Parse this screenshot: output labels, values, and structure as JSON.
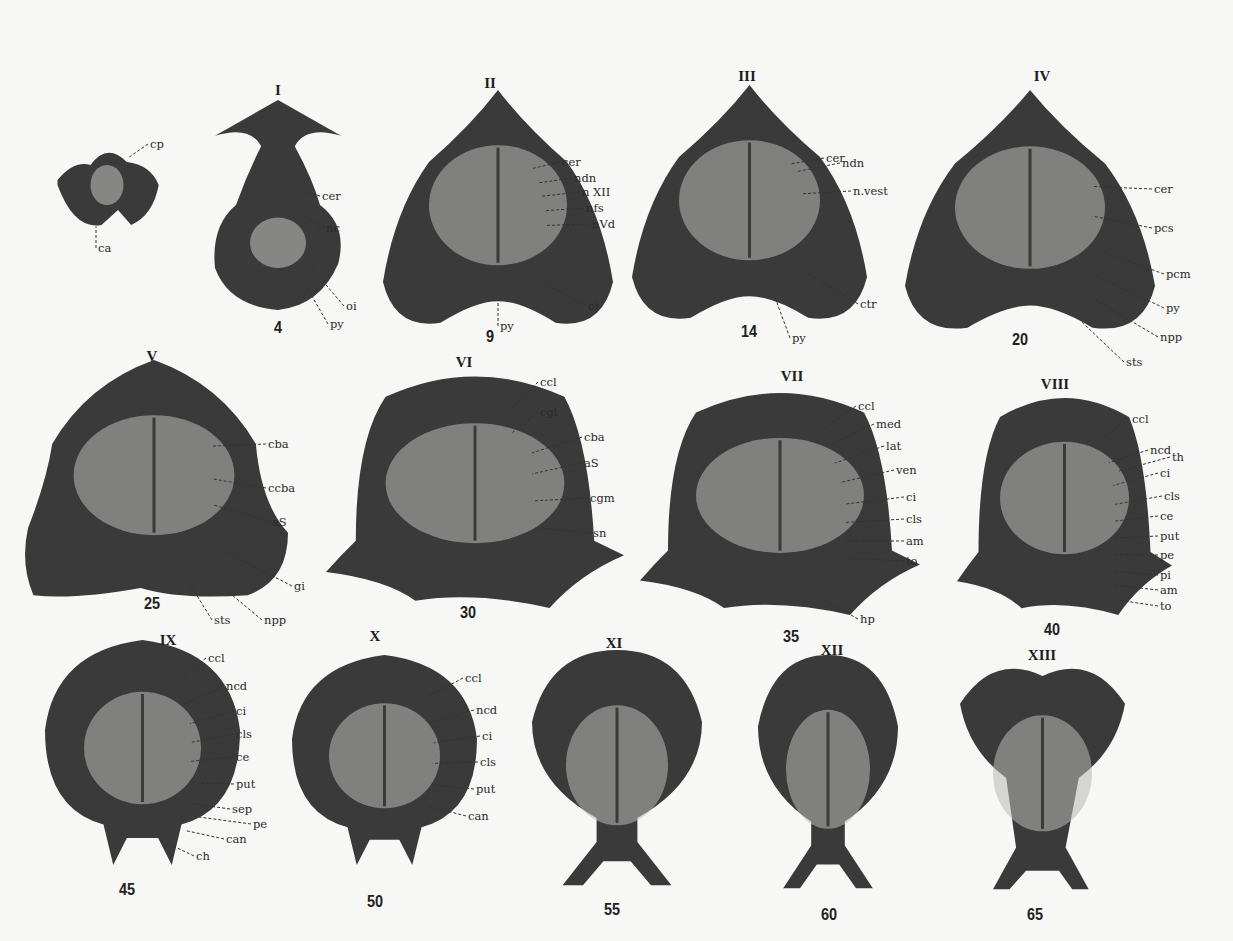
{
  "figure": {
    "background": "#f7f7f5",
    "tissue_dark": "#3a3a3a",
    "tissue_light": "#b9b9b6",
    "sections": [
      {
        "roman": "V",
        "number": "",
        "labels": [
          "cp",
          "ca"
        ]
      },
      {
        "roman": "I",
        "number": "4",
        "labels": [
          "cer",
          "nc",
          "oi",
          "py"
        ]
      },
      {
        "roman": "II",
        "number": "9",
        "labels": [
          "cer",
          "ndn",
          "n XII",
          "nfs",
          "nVd",
          "oi",
          "py"
        ]
      },
      {
        "roman": "III",
        "number": "14",
        "labels": [
          "cer",
          "ndn",
          "n.vest",
          "ctr",
          "py"
        ]
      },
      {
        "roman": "IV",
        "number": "20",
        "labels": [
          "cer",
          "pcs",
          "pcm",
          "py",
          "npp",
          "sts"
        ]
      },
      {
        "roman": "V",
        "number": "25",
        "labels": [
          "cba",
          "ccba",
          "aS",
          "gi",
          "npp",
          "sts"
        ]
      },
      {
        "roman": "VI",
        "number": "30",
        "labels": [
          "ccl",
          "cgl",
          "cba",
          "aS",
          "cgm",
          "sn"
        ]
      },
      {
        "roman": "VII",
        "number": "35",
        "labels": [
          "ccl",
          "med",
          "lat",
          "ven",
          "ci",
          "cls",
          "am",
          "to",
          "hp"
        ]
      },
      {
        "roman": "VIII",
        "number": "40",
        "labels": [
          "ccl",
          "ncd",
          "th",
          "ci",
          "cls",
          "ce",
          "put",
          "pe",
          "pi",
          "am",
          "to"
        ]
      },
      {
        "roman": "IX",
        "number": "45",
        "labels": [
          "ccl",
          "ncd",
          "ci",
          "cls",
          "ce",
          "put",
          "sep",
          "pe",
          "can",
          "ch"
        ]
      },
      {
        "roman": "X",
        "number": "50",
        "labels": [
          "ccl",
          "ncd",
          "ci",
          "cls",
          "put",
          "can"
        ]
      },
      {
        "roman": "XI",
        "number": "55",
        "labels": []
      },
      {
        "roman": "XII",
        "number": "60",
        "labels": []
      },
      {
        "roman": "XIII",
        "number": "65",
        "labels": []
      }
    ]
  }
}
